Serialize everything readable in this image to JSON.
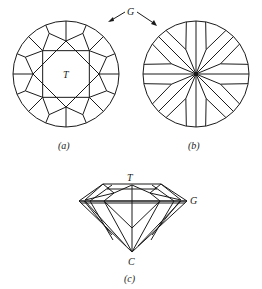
{
  "figure": {
    "labels": {
      "girdle": "G",
      "table": "T",
      "culet": "C"
    },
    "captions": {
      "a": "(a)",
      "b": "(b)",
      "c": "(c)"
    },
    "panels": [
      {
        "id": "a",
        "view": "crown (top) view",
        "center": [
          66,
          74
        ],
        "radius": 53
      },
      {
        "id": "b",
        "view": "pavilion (bottom) view",
        "center": [
          196,
          74
        ],
        "radius": 53
      },
      {
        "id": "c",
        "view": "side profile",
        "girdle_y": 201,
        "table_y": 184,
        "culet": [
          132,
          252
        ]
      }
    ]
  }
}
